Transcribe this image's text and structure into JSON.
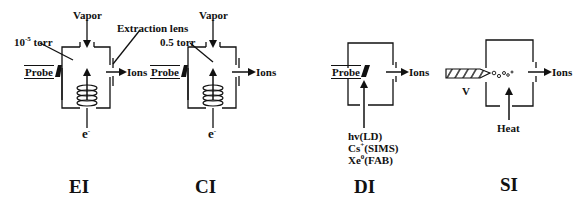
{
  "figure": {
    "panels": [
      {
        "id": "EI",
        "title": "EI",
        "pressure_prefix": "10",
        "pressure_exp": "-5",
        "pressure_suffix": " torr",
        "inlet_label": "Vapor",
        "probe_label": "Probe",
        "output_label": "Ions",
        "source_label": "e",
        "source_sup": "-",
        "lens_label": "Extraction lens"
      },
      {
        "id": "CI",
        "title": "CI",
        "pressure_label": "0.5 torr",
        "inlet_label": "Vapor",
        "probe_label": "Probe",
        "output_label": "Ions",
        "source_label": "e",
        "source_sup": "-"
      },
      {
        "id": "DI",
        "title": "DI",
        "probe_label": "Probe",
        "output_label": "Ions",
        "beam_labels": [
          {
            "base": "hv(LD)",
            "sup": ""
          },
          {
            "base": "Cs",
            "sup": "+",
            "rest": "(SIMS)"
          },
          {
            "base": "Xe",
            "sup": "0",
            "rest": "(FAB)"
          }
        ]
      },
      {
        "id": "SI",
        "title": "SI",
        "probe_label": "V",
        "output_label": "Ions",
        "heat_label": "Heat"
      }
    ]
  }
}
